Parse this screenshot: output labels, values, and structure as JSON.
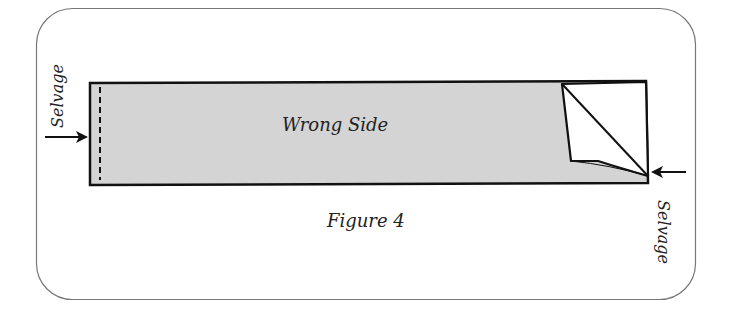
{
  "figure": {
    "caption": "Figure 4",
    "fabric_label": "Wrong Side",
    "selvage_left_label": "Selvage",
    "selvage_right_label": "Selvage",
    "colors": {
      "frame": "#777777",
      "fabric_fill": "#d4d4d4",
      "outline": "#111111",
      "fold_fill": "#ffffff"
    }
  }
}
